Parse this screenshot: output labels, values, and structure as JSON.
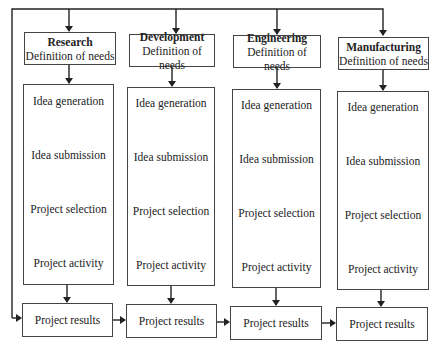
{
  "diagram": {
    "columns": [
      {
        "title": "Research",
        "subtitle": "Definition of needs",
        "steps": [
          "Idea generation",
          "Idea submission",
          "Project selection",
          "Project activity"
        ],
        "result": "Project results"
      },
      {
        "title": "Development",
        "subtitle": "Definition of needs",
        "steps": [
          "Idea generation",
          "Idea submission",
          "Project selection",
          "Project activity"
        ],
        "result": "Project results"
      },
      {
        "title": "Engineering",
        "subtitle": "Definition of needs",
        "steps": [
          "Idea generation",
          "Idea submission",
          "Project selection",
          "Project activity"
        ],
        "result": "Project results"
      },
      {
        "title": "Manufacturing",
        "subtitle": "Definition of needs",
        "steps": [
          "Idea generation",
          "Idea submission",
          "Project selection",
          "Project activity"
        ],
        "result": "Project results"
      }
    ],
    "colors": {
      "line": "#222222",
      "box_border": "#444444",
      "background": "#ffffff"
    }
  }
}
